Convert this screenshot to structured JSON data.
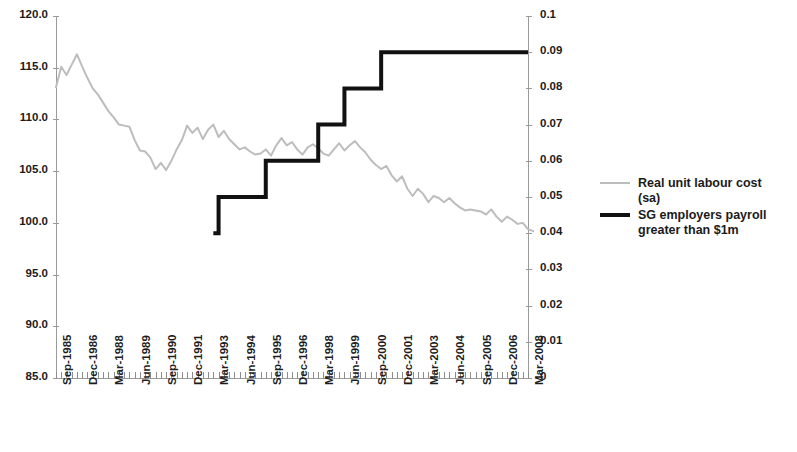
{
  "chart_data": {
    "type": "line",
    "title": "",
    "xlabel": "",
    "ylabel": "",
    "y2label": "",
    "grid": false,
    "legend_position": "right",
    "ylim": [
      85.0,
      120.0
    ],
    "y2lim": [
      0,
      0.1
    ],
    "yticks": [
      "85.0",
      "90.0",
      "95.0",
      "100.0",
      "105.0",
      "110.0",
      "115.0",
      "120.0"
    ],
    "y2ticks": [
      "0",
      "0.01",
      "0.02",
      "0.03",
      "0.04",
      "0.05",
      "0.06",
      "0.07",
      "0.08",
      "0.09",
      "0.1"
    ],
    "xtick_labels": [
      "Sep-1985",
      "Dec-1986",
      "Mar-1988",
      "Jun-1989",
      "Sep-1990",
      "Dec-1991",
      "Mar-1993",
      "Jun-1994",
      "Sep-1995",
      "Dec-1996",
      "Mar-1998",
      "Jun-1999",
      "Sep-2000",
      "Dec-2001",
      "Mar-2003",
      "Jun-2004",
      "Sep-2005",
      "Dec-2006",
      "Mar-2008"
    ],
    "x_quarters": 91,
    "x_start": "Sep-1985",
    "x_end": "Mar-2008",
    "series": [
      {
        "name": "Real unit labour cost (sa)",
        "color": "#bdbdbd",
        "axis": "left",
        "type": "line",
        "values": [
          113.1,
          115.1,
          114.3,
          115.3,
          116.3,
          115.1,
          114.0,
          113.0,
          112.4,
          111.6,
          110.8,
          110.2,
          109.5,
          109.4,
          109.3,
          108.0,
          107.0,
          106.9,
          106.3,
          105.2,
          105.8,
          105.1,
          106.0,
          107.1,
          108.0,
          109.4,
          108.7,
          109.2,
          108.1,
          109.0,
          109.5,
          108.3,
          108.9,
          108.1,
          107.6,
          107.1,
          107.3,
          106.9,
          106.6,
          106.7,
          107.1,
          106.5,
          107.5,
          108.2,
          107.5,
          107.8,
          107.1,
          106.6,
          107.3,
          107.6,
          107.2,
          106.7,
          106.5,
          107.1,
          107.7,
          107.0,
          107.5,
          107.9,
          107.3,
          106.8,
          106.1,
          105.6,
          105.2,
          105.5,
          104.6,
          104.0,
          104.5,
          103.3,
          102.6,
          103.3,
          102.8,
          102.0,
          102.6,
          102.4,
          102.0,
          102.4,
          101.9,
          101.5,
          101.2,
          101.3,
          101.2,
          101.1,
          100.8,
          101.3,
          100.6,
          100.1,
          100.6,
          100.3,
          99.9,
          100.0,
          99.4,
          99.2
        ]
      },
      {
        "name": "SG employers payroll greater than $1m",
        "color": "#111111",
        "axis": "right",
        "type": "step",
        "steps": [
          {
            "from_label": "Mar-1993",
            "value": 0.04
          },
          {
            "from_label": "Jun-1993",
            "value": 0.05
          },
          {
            "from_label": "Sep-1995",
            "value": 0.06
          },
          {
            "from_label": "Mar-1998",
            "value": 0.07
          },
          {
            "from_label": "Jun-1999",
            "value": 0.08
          },
          {
            "from_label": "Mar-2001",
            "value": 0.09
          },
          {
            "from_label": "Mar-2008",
            "value": 0.09
          }
        ]
      }
    ]
  },
  "legend": {
    "items": [
      {
        "label": "Real unit labour cost (sa)",
        "style": "thin-grey-line"
      },
      {
        "label": "SG employers payroll greater than $1m",
        "style": "thick-black-line"
      }
    ]
  }
}
